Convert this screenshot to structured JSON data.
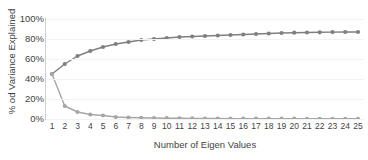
{
  "chart_data": {
    "type": "line",
    "title": "Scree Plot/Curve",
    "xlabel": "Number of Eigen Values",
    "ylabel": "% od Variance Explained",
    "x": [
      1,
      2,
      3,
      4,
      5,
      6,
      7,
      8,
      9,
      10,
      11,
      12,
      13,
      14,
      15,
      16,
      17,
      18,
      19,
      20,
      21,
      22,
      23,
      24,
      25
    ],
    "categories": [
      "1",
      "2",
      "3",
      "4",
      "5",
      "6",
      "7",
      "8",
      "9",
      "10",
      "11",
      "12",
      "13",
      "14",
      "15",
      "16",
      "17",
      "18",
      "19",
      "20",
      "21",
      "22",
      "23",
      "24",
      "25"
    ],
    "xtick_labels": [
      "1",
      "2",
      "3",
      "4",
      "5",
      "6",
      "7",
      "8",
      "9",
      "10",
      "11",
      "12",
      "13",
      "14",
      "15",
      "16",
      "17",
      "18",
      "19",
      "20",
      "21",
      "22",
      "23",
      "24",
      "25"
    ],
    "ytick_labels": [
      "100%",
      "80%",
      "60%",
      "40%",
      "20%",
      "0%"
    ],
    "ytick_values": [
      100,
      80,
      60,
      40,
      20,
      0
    ],
    "ylim": [
      0,
      100
    ],
    "xlim": [
      1,
      25
    ],
    "grid": true,
    "legend": "none",
    "series": [
      {
        "name": "Cumulative % of Variance Explained",
        "color": "#7f7f7f",
        "values": [
          45,
          55,
          63,
          68,
          72,
          75,
          77,
          79,
          80,
          81,
          82,
          82.5,
          83,
          83.5,
          84,
          84.5,
          85,
          85.5,
          86,
          86.3,
          86.5,
          86.7,
          86.9,
          87,
          87
        ]
      },
      {
        "name": "Individual % of Variance Explained",
        "color": "#a6a6a6",
        "values": [
          45,
          13,
          7,
          4.5,
          3.5,
          2,
          1.5,
          1.2,
          1,
          0.8,
          0.7,
          0.6,
          0.5,
          0.5,
          0.4,
          0.4,
          0.4,
          0.3,
          0.3,
          0.3,
          0.2,
          0.2,
          0.2,
          0.2,
          0.2
        ]
      }
    ]
  }
}
